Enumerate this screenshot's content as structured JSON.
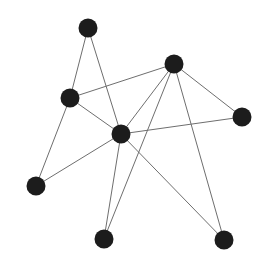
{
  "diagram": {
    "type": "network-graph",
    "node_color": "#1c1c1c",
    "edge_color": "#6e6e6e",
    "edge_width": 1,
    "node_radius": 9.5,
    "nodes": [
      {
        "id": "n1",
        "x": 88,
        "y": 28
      },
      {
        "id": "n2",
        "x": 174,
        "y": 64
      },
      {
        "id": "n3",
        "x": 70,
        "y": 98
      },
      {
        "id": "n4",
        "x": 242,
        "y": 117
      },
      {
        "id": "n5",
        "x": 121,
        "y": 134
      },
      {
        "id": "n6",
        "x": 36,
        "y": 186
      },
      {
        "id": "n7",
        "x": 104,
        "y": 239
      },
      {
        "id": "n8",
        "x": 224,
        "y": 240
      }
    ],
    "edges": [
      [
        "n1",
        "n3"
      ],
      [
        "n1",
        "n5"
      ],
      [
        "n3",
        "n2"
      ],
      [
        "n3",
        "n5"
      ],
      [
        "n3",
        "n6"
      ],
      [
        "n2",
        "n5"
      ],
      [
        "n2",
        "n7"
      ],
      [
        "n2",
        "n4"
      ],
      [
        "n2",
        "n8"
      ],
      [
        "n5",
        "n4"
      ],
      [
        "n5",
        "n6"
      ],
      [
        "n5",
        "n7"
      ],
      [
        "n5",
        "n8"
      ]
    ],
    "clipped_title_fragments": [
      14,
      22,
      30,
      10
    ]
  }
}
